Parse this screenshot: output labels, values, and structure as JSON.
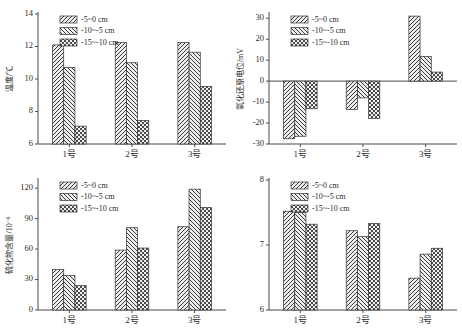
{
  "figure": {
    "background": "#ffffff",
    "series_colors": [
      "#e8e8e8",
      "#dcdcdc",
      "#d2d2d2"
    ],
    "outline_color": "#333333"
  },
  "legend": {
    "items": [
      {
        "label": "-5~0 cm",
        "pattern": "hatch-forward",
        "name": "legend-series-1"
      },
      {
        "label": "-10~-5 cm",
        "pattern": "hatch-backward",
        "name": "legend-series-2"
      },
      {
        "label": "-15~-10 cm",
        "pattern": "checker",
        "name": "legend-series-3"
      }
    ]
  },
  "categories": [
    "1号",
    "2号",
    "3号"
  ],
  "chart_data": [
    {
      "id": "temperature",
      "type": "bar",
      "title": "",
      "xlabel": "",
      "ylabel": "温度/℃",
      "ylabel_plain": "温度/℃",
      "categories": [
        "1号",
        "2号",
        "3号"
      ],
      "ylim": [
        6,
        14
      ],
      "yticks": [
        6,
        8,
        10,
        12,
        14
      ],
      "ytick_labels": [
        "6",
        "8",
        "10",
        "12",
        "14"
      ],
      "grid": false,
      "legend_position": "top-left",
      "series": [
        {
          "name": "-5~0 cm",
          "values": [
            12.1,
            12.25,
            12.25
          ]
        },
        {
          "name": "-10~-5 cm",
          "values": [
            10.7,
            11.0,
            11.65
          ]
        },
        {
          "name": "-15~-10 cm",
          "values": [
            7.1,
            7.45,
            9.55
          ]
        }
      ]
    },
    {
      "id": "redox",
      "type": "bar",
      "title": "",
      "xlabel": "",
      "ylabel": "氧化还原电位/mV",
      "ylabel_plain": "氧化还原电位/mV",
      "categories": [
        "1号",
        "2号",
        "3号"
      ],
      "ylim": [
        -30,
        32
      ],
      "yticks": [
        -30,
        -20,
        -10,
        0,
        10,
        20,
        30
      ],
      "ytick_labels": [
        "-30",
        "-20",
        "-10",
        "0",
        "10",
        "20",
        "30"
      ],
      "grid": false,
      "legend_position": "top-left",
      "series": [
        {
          "name": "-5~0 cm",
          "values": [
            -27.5,
            -13.5,
            31.0
          ]
        },
        {
          "name": "-10~-5 cm",
          "values": [
            -26.3,
            -8.0,
            11.7
          ]
        },
        {
          "name": "-15~-10 cm",
          "values": [
            -13.2,
            -17.8,
            4.3
          ]
        }
      ]
    },
    {
      "id": "sulfide",
      "type": "bar",
      "title": "",
      "xlabel": "",
      "ylabel": "硫化物含量/10⁻⁶",
      "ylabel_plain": "硫化物含量/10-6",
      "categories": [
        "1号",
        "2号",
        "3号"
      ],
      "ylim": [
        0,
        128
      ],
      "yticks": [
        0,
        30,
        60,
        90,
        120
      ],
      "ytick_labels": [
        "0",
        "30",
        "60",
        "90",
        "120"
      ],
      "grid": false,
      "legend_position": "top-left",
      "series": [
        {
          "name": "-5~0 cm",
          "values": [
            40,
            59,
            82
          ]
        },
        {
          "name": "-10~-5 cm",
          "values": [
            34,
            81,
            119
          ]
        },
        {
          "name": "-15~-10 cm",
          "values": [
            24,
            61,
            101
          ]
        }
      ]
    },
    {
      "id": "ph",
      "type": "bar",
      "title": "",
      "xlabel": "",
      "ylabel": "",
      "ylabel_plain": "",
      "categories": [
        "1号",
        "2号",
        "3号"
      ],
      "ylim": [
        6,
        8
      ],
      "yticks": [
        6,
        7,
        8
      ],
      "ytick_labels": [
        "6",
        "7",
        "8"
      ],
      "grid": false,
      "legend_position": "top-left",
      "series": [
        {
          "name": "-5~0 cm",
          "values": [
            7.52,
            7.22,
            6.49
          ]
        },
        {
          "name": "-10~-5 cm",
          "values": [
            7.5,
            7.13,
            6.86
          ]
        },
        {
          "name": "-15~-10 cm",
          "values": [
            7.32,
            7.33,
            6.95
          ]
        }
      ]
    }
  ]
}
